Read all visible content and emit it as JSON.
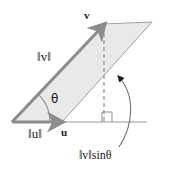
{
  "figure": {
    "type": "geometry-diagram",
    "colors": {
      "fill": "#e9e9e9",
      "vector_stroke": "#8c8c8c",
      "thin_stroke": "#9a9a9a",
      "dashed_stroke": "#8f8f8f",
      "text": "#1a1a1a",
      "background": "#ffffff"
    }
  },
  "labels": {
    "vector_v_head": "v",
    "norm_v": "‖v‖",
    "theta": "θ",
    "norm_u": "‖u‖",
    "vector_u_head": "u",
    "height_prefix": "‖v‖",
    "height_suffix": "sinθ",
    "height_full": "‖v‖sinθ"
  },
  "geometry": {
    "origin": [
      12,
      122
    ],
    "u_tip": [
      62,
      122
    ],
    "v_tip": [
      104,
      25
    ],
    "parallelogram_vertices": [
      [
        12,
        122
      ],
      [
        104,
        25
      ],
      [
        152,
        22
      ],
      [
        62,
        122
      ]
    ],
    "baseline": [
      [
        12,
        122
      ],
      [
        147,
        122
      ]
    ],
    "dashed_drop": [
      [
        104,
        26
      ],
      [
        104,
        122
      ]
    ],
    "right_angle_square": [
      [
        102,
        112
      ],
      [
        112,
        112
      ],
      [
        112,
        122
      ],
      [
        102,
        122
      ]
    ],
    "curved_arrow_from": [
      118,
      146
    ],
    "curved_arrow_to": [
      110,
      70
    ],
    "angle_arc_radius": 38
  }
}
